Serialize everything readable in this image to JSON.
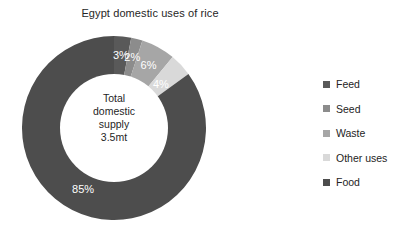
{
  "chart_data": {
    "type": "pie",
    "variant": "donut",
    "title": "Egypt domestic uses of rice",
    "categories": [
      "Feed",
      "Seed",
      "Waste",
      "Other uses",
      "Food"
    ],
    "values": [
      3,
      2,
      6,
      4,
      85
    ],
    "value_labels": [
      "3%",
      "2%",
      "6%",
      "4%",
      "85%"
    ],
    "unit": "percent",
    "colors": [
      "#595959",
      "#8c8c8c",
      "#a6a6a6",
      "#d9d9d9",
      "#4d4d4d"
    ],
    "start_angle_deg": 0,
    "direction": "clockwise",
    "legend_position": "right",
    "grid": false,
    "xlabel": "",
    "ylabel": "",
    "center_annotation": {
      "line1": "Total",
      "line2": "domestic",
      "line3": "supply",
      "line4": "3.5mt"
    }
  },
  "legend": {
    "items": [
      {
        "label": "Feed",
        "color": "#595959"
      },
      {
        "label": "Seed",
        "color": "#8c8c8c"
      },
      {
        "label": "Waste",
        "color": "#a6a6a6"
      },
      {
        "label": "Other uses",
        "color": "#d9d9d9"
      },
      {
        "label": "Food",
        "color": "#4d4d4d"
      }
    ]
  }
}
